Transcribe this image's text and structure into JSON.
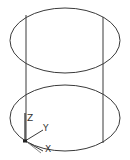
{
  "drawing": {
    "type": "wireframe-cylinder",
    "line_color": "#3a3a3a",
    "background": "#ffffff",
    "top_ellipse": {
      "cx": 65,
      "cy": 40.5,
      "rx": 55,
      "ry": 32.5
    },
    "bottom_ellipse": {
      "cx": 65,
      "cy": 118,
      "rx": 55,
      "ry": 33
    },
    "silhouette_lines": [
      {
        "x1": 26,
        "y1": 15,
        "x2": 26,
        "y2": 141
      },
      {
        "x1": 103,
        "y1": 17,
        "x2": 103,
        "y2": 143
      }
    ]
  },
  "ucs_icon": {
    "origin": {
      "x": 25,
      "y": 141
    },
    "labels": {
      "z": "Z",
      "y": "Y",
      "x": "X"
    }
  }
}
